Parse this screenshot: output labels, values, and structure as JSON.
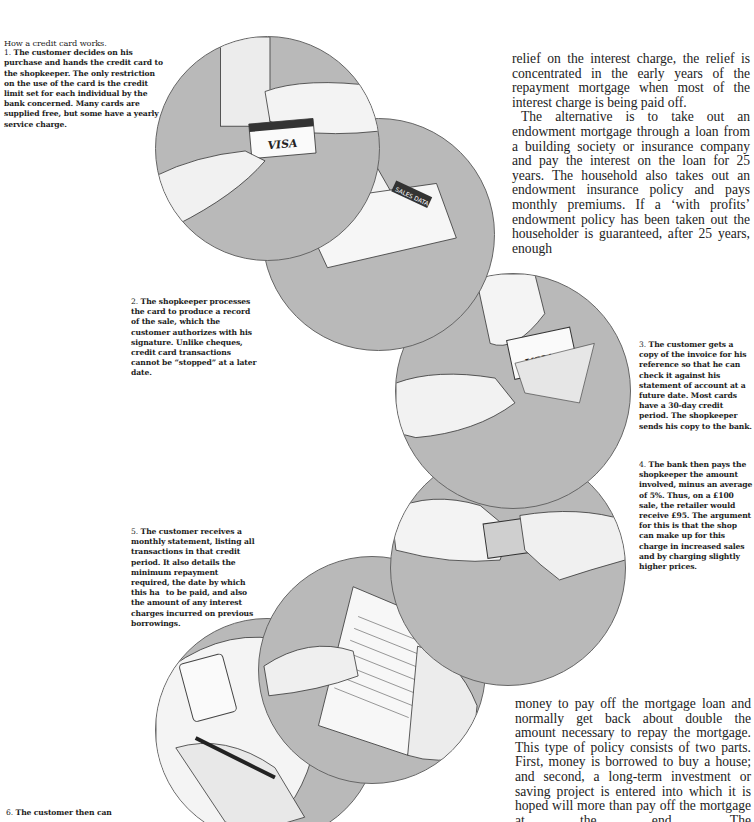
{
  "intro": {
    "title": "How a credit card works."
  },
  "steps": [
    {
      "num": "1.",
      "text": "The customer decides on his purchase and hands the credit card to the shopkeeper. The only restriction on the use of the card is the credit limit set for each individual by the bank concerned. Many cards are supplied free, but some have a yearly service charge."
    },
    {
      "num": "2.",
      "text": "The shopkeeper processes the card to produce a record of the sale, which the customer authorizes with his signature. Unlike cheques, credit card transactions cannot be “stopped” at a later date."
    },
    {
      "num": "3.",
      "text": "The customer gets a copy of the invoice for his reference so that he can check it against his statement of account at a future date. Most cards have a 30-day credit period. The shopkeeper sends his copy to the bank."
    },
    {
      "num": "4.",
      "text": "The bank then pays the shopkeeper the amount involved, minus an average of 5%. Thus, on a £100 sale, the retailer would receive £95. The argument for this is that the shop can make up for this charge in increased sales and by charging slightly higher prices."
    },
    {
      "num": "5.",
      "text": "The customer receives a monthly statement, listing all transactions in that credit period. It also details the minimum repayment required, the date by which this ha  to be paid, and also the amount of any interest charges incurred on previous borrowings."
    },
    {
      "num": "6.",
      "text": "The customer then can"
    }
  ],
  "article": {
    "top_paragraphs": [
      "relief on the interest charge, the relief is concentrated in the early years of the repayment mortgage when most of the interest charge is being paid off.",
      "The alternative is to take out an endowment mortgage through a loan from a building society or insurance company and pay the interest on the loan for 25 years. The household also takes out an endowment insurance policy and pays monthly premiums. If a ‘with profits’ endowment policy has been taken out the householder is guaranteed, after 25 years, enough"
    ],
    "bottom_paragraph": "money to pay off the mortgage loan and normally get back about double the amount necessary to repay the mortgage. This type of policy consists of two parts. First, money is borrowed to buy a house; and second, a long-term investment or saving project is entered into which it is hoped will more than pay off the mortgage at the end. The"
  },
  "illustrations": [
    {
      "id": "card-handover",
      "label": "VISA",
      "card_header": "BANKAMERICARD"
    },
    {
      "id": "card-imprinter",
      "label": "ADDRESSOGRAPH",
      "device_text": "SALES DATA"
    },
    {
      "id": "invoice-copy",
      "label": "VISA"
    },
    {
      "id": "bank-payment",
      "label": "banknotes"
    },
    {
      "id": "monthly-statement",
      "label": "statement"
    },
    {
      "id": "cash-withdrawal",
      "label": "cash"
    }
  ],
  "colors": {
    "circle_fill": "#b9b9b9",
    "circle_border": "#666666",
    "text": "#1a1a1a",
    "background": "#ffffff"
  }
}
